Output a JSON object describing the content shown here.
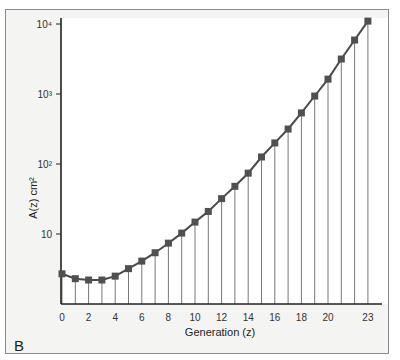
{
  "panel_label": "B",
  "chart_data": {
    "type": "line",
    "title": "",
    "xlabel": "Generation (z)",
    "ylabel": "A(z) cm²",
    "yscale": "log",
    "ylim": [
      1,
      10000
    ],
    "xlim": [
      0,
      23
    ],
    "x_ticks": [
      0,
      2,
      4,
      6,
      8,
      10,
      12,
      14,
      16,
      18,
      20,
      23
    ],
    "y_ticks": [
      {
        "value": 10,
        "label": "10"
      },
      {
        "value": 100,
        "label": "10²"
      },
      {
        "value": 1000,
        "label": "10³"
      },
      {
        "value": 10000,
        "label": "10⁴"
      }
    ],
    "grid": "vertical drop lines at each generation",
    "marker": "square",
    "x": [
      0,
      1,
      2,
      3,
      4,
      5,
      6,
      7,
      8,
      9,
      10,
      11,
      12,
      13,
      14,
      15,
      16,
      17,
      18,
      19,
      20,
      21,
      22,
      23
    ],
    "series": [
      {
        "name": "A(z)",
        "values": [
          2.7,
          2.3,
          2.2,
          2.2,
          2.5,
          3.2,
          4.1,
          5.4,
          7.4,
          10.3,
          14.8,
          21,
          32,
          48,
          74,
          126,
          200,
          316,
          537,
          935,
          1630,
          3160,
          5900,
          11000
        ]
      }
    ],
    "colors": {
      "line": "#4a4a4a",
      "marker": "#505050",
      "droplines": "#555555",
      "background": "#f4f4f2",
      "plot_bg": "#ffffff"
    }
  }
}
